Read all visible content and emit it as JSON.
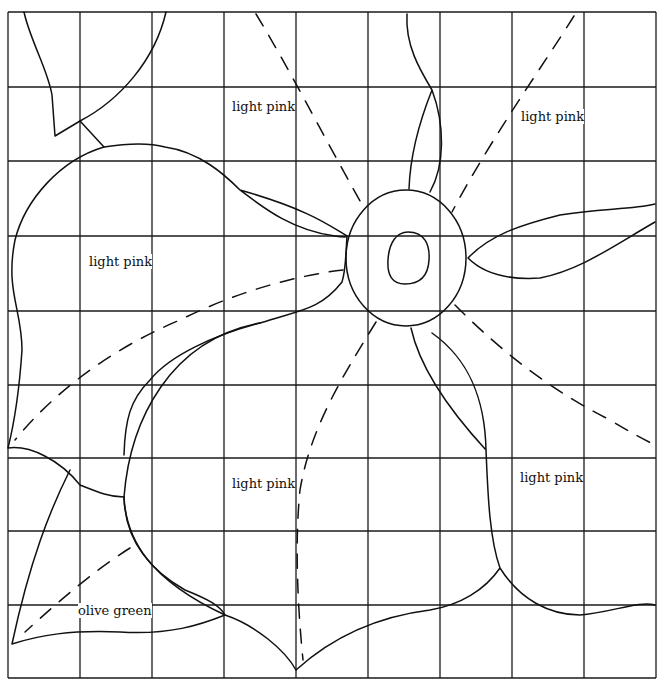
{
  "pattern": {
    "grid": {
      "columns": [
        8,
        80,
        152,
        224,
        296,
        368,
        440,
        512,
        584,
        656
      ],
      "rows": [
        12,
        87,
        161,
        236,
        311,
        385,
        458,
        531,
        605,
        678
      ]
    },
    "labels": [
      {
        "id": "top-center-petal",
        "text": "light pink",
        "x": 232,
        "y": 107
      },
      {
        "id": "top-right-petal",
        "text": "light pink",
        "x": 521,
        "y": 117
      },
      {
        "id": "left-petal",
        "text": "light pink",
        "x": 89,
        "y": 262
      },
      {
        "id": "bottom-center-petal",
        "text": "light pink",
        "x": 232,
        "y": 484
      },
      {
        "id": "bottom-right-petal",
        "text": "light pink",
        "x": 520,
        "y": 478
      },
      {
        "id": "leaf",
        "text": "olive green",
        "x": 78,
        "y": 611
      }
    ],
    "colors": {
      "line": "#111111",
      "background": "#ffffff"
    }
  }
}
